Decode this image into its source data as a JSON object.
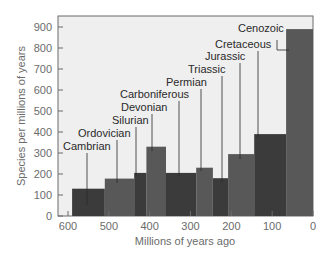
{
  "chart_data": {
    "type": "bar",
    "title": "",
    "xlabel": "Millions of years ago",
    "ylabel": "Species per millions of years",
    "xlim": [
      620,
      0
    ],
    "ylim": [
      0,
      940
    ],
    "x_ticks": [
      600,
      500,
      400,
      300,
      200,
      100,
      0
    ],
    "y_ticks": [
      0,
      100,
      200,
      300,
      400,
      500,
      600,
      700,
      800,
      900
    ],
    "grid": false,
    "legend": null,
    "bars": [
      {
        "period": "Cambrian",
        "start": 590,
        "end": 510,
        "value": 130,
        "shade": "dark"
      },
      {
        "period": "Ordovician",
        "start": 510,
        "end": 438,
        "value": 178,
        "shade": "medium"
      },
      {
        "period": "Silurian",
        "start": 438,
        "end": 408,
        "value": 205,
        "shade": "dark"
      },
      {
        "period": "Devonian",
        "start": 408,
        "end": 360,
        "value": 330,
        "shade": "medium"
      },
      {
        "period": "Carboniferous",
        "start": 360,
        "end": 286,
        "value": 205,
        "shade": "dark"
      },
      {
        "period": "Permian",
        "start": 286,
        "end": 245,
        "value": 230,
        "shade": "medium"
      },
      {
        "period": "Triassic",
        "start": 245,
        "end": 208,
        "value": 180,
        "shade": "dark"
      },
      {
        "period": "Jurassic",
        "start": 208,
        "end": 144,
        "value": 295,
        "shade": "medium"
      },
      {
        "period": "Cretaceous",
        "start": 144,
        "end": 66,
        "value": 390,
        "shade": "dark"
      },
      {
        "period": "Cenozoic",
        "start": 66,
        "end": 0,
        "value": 890,
        "shade": "medium"
      }
    ],
    "categories": [
      "Cambrian",
      "Ordovician",
      "Silurian",
      "Devonian",
      "Carboniferous",
      "Permian",
      "Triassic",
      "Jurassic",
      "Cretaceous",
      "Cenozoic"
    ],
    "values": [
      130,
      178,
      205,
      330,
      205,
      230,
      180,
      295,
      390,
      890
    ],
    "colors": {
      "dark": "#3b3b3b",
      "medium": "#585858",
      "plot_bg": "#efefef",
      "axis": "#6b6b6b",
      "leader": "#2a2a2a"
    },
    "labels": [
      {
        "text": "Cambrian",
        "x": 63,
        "y": 150,
        "lx": 87,
        "ly1": 153,
        "ly2": 205
      },
      {
        "text": "Ordovician",
        "x": 78,
        "y": 137,
        "lx": 117,
        "ly1": 140,
        "ly2": 183
      },
      {
        "text": "Silurian",
        "x": 112,
        "y": 124,
        "lx": 136,
        "ly1": 127,
        "ly2": 177
      },
      {
        "text": "Devonian",
        "x": 121,
        "y": 111,
        "lx": 152,
        "ly1": 114,
        "ly2": 151
      },
      {
        "text": "Carboniferous",
        "x": 120,
        "y": 98,
        "lx": 179,
        "ly1": 101,
        "ly2": 176
      },
      {
        "text": "Permian",
        "x": 166,
        "y": 86,
        "lx": 201,
        "ly1": 89,
        "ly2": 171
      },
      {
        "text": "Triassic",
        "x": 188,
        "y": 73,
        "lx": 222,
        "ly1": 76,
        "ly2": 182
      },
      {
        "text": "Jurassic",
        "x": 205,
        "y": 60,
        "lx": 240,
        "ly1": 63,
        "ly2": 159
      },
      {
        "text": "Cretaceous",
        "x": 215,
        "y": 48,
        "lx": 258,
        "ly1": 51,
        "ly2": 137
      },
      {
        "text": "Cenozoic",
        "x": 238,
        "y": 32,
        "lx": 277,
        "ly1": 40,
        "ly2": 50,
        "elbow_x": 289
      }
    ]
  }
}
